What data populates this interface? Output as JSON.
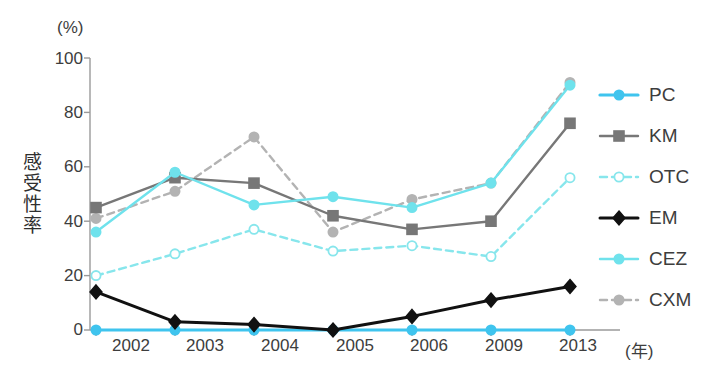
{
  "chart_data": {
    "type": "line",
    "title": "",
    "subtitle": "",
    "xlabel": "(年)",
    "ylabel": "感受性率",
    "yunit": "(%)",
    "categories": [
      "2002",
      "2003",
      "2004",
      "2005",
      "2006",
      "2009",
      "2013"
    ],
    "x": [
      2002,
      2003,
      2004,
      2005,
      2006,
      2009,
      2013
    ],
    "ylim": [
      0,
      100
    ],
    "yticks": [
      0,
      20,
      40,
      60,
      80,
      100
    ],
    "grid": false,
    "legend_position": "right",
    "series": [
      {
        "name": "PC",
        "values": [
          0,
          0,
          0,
          0,
          0,
          0,
          0
        ],
        "color": "#3FC4EE",
        "line_style": "solid",
        "marker": "circle",
        "marker_filled": true
      },
      {
        "name": "KM",
        "values": [
          45,
          56,
          54,
          42,
          37,
          40,
          76
        ],
        "color": "#777777",
        "line_style": "solid",
        "marker": "square",
        "marker_filled": true
      },
      {
        "name": "OTC",
        "values": [
          20,
          28,
          37,
          29,
          31,
          27,
          56
        ],
        "color": "#87E6EC",
        "line_style": "dashed",
        "marker": "circle",
        "marker_filled": false
      },
      {
        "name": "EM",
        "values": [
          14,
          3,
          2,
          0,
          5,
          11,
          16
        ],
        "color": "#111111",
        "line_style": "solid",
        "marker": "diamond",
        "marker_filled": true
      },
      {
        "name": "CEZ",
        "values": [
          36,
          58,
          46,
          49,
          45,
          54,
          90
        ],
        "color": "#6FE2EC",
        "line_style": "solid",
        "marker": "circle",
        "marker_filled": true
      },
      {
        "name": "CXM",
        "values": [
          41,
          51,
          71,
          36,
          48,
          54,
          91
        ],
        "color": "#B3B3B3",
        "line_style": "dashed",
        "marker": "circle",
        "marker_filled": true
      }
    ]
  },
  "axis": {
    "y_unit_label": "(%)",
    "y_title": "感受性率",
    "x_unit_label": "(年)",
    "y_tick_labels": [
      "100",
      "80",
      "60",
      "40",
      "20",
      "0"
    ],
    "x_tick_labels": [
      "2002",
      "2003",
      "2004",
      "2005",
      "2006",
      "2009",
      "2013"
    ]
  },
  "legend": {
    "items": [
      {
        "label": "PC"
      },
      {
        "label": "KM"
      },
      {
        "label": "OTC"
      },
      {
        "label": "EM"
      },
      {
        "label": "CEZ"
      },
      {
        "label": "CXM"
      }
    ]
  },
  "colors": {
    "axis": "#9a9a9a",
    "text": "#3d3d3d",
    "background": "#ffffff"
  }
}
